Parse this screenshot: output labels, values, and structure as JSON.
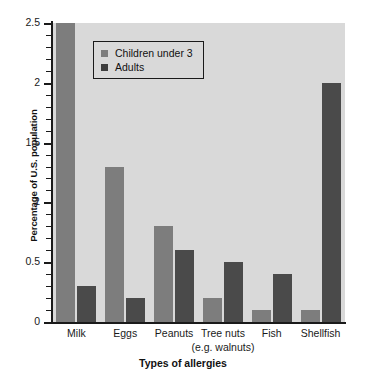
{
  "chart_data": {
    "type": "bar",
    "title": "",
    "xlabel": "Types of allergies",
    "ylabel": "Percentage of U.S. population",
    "categories": [
      "Milk",
      "Eggs",
      "Peanuts",
      "Tree nuts",
      "Fish",
      "Shellfish"
    ],
    "category_sublabels": [
      "",
      "",
      "",
      "(e.g. walnuts)",
      "",
      ""
    ],
    "series": [
      {
        "name": "Children under 3",
        "color": "#7d7d7d",
        "values": [
          2.5,
          1.3,
          0.8,
          0.2,
          0.1,
          0.1
        ]
      },
      {
        "name": "Adults",
        "color": "#4a4a4a",
        "values": [
          0.3,
          0.2,
          0.6,
          0.5,
          0.4,
          2.0
        ]
      }
    ],
    "ylim": [
      0,
      2.5
    ],
    "ytick_labels": [
      "0",
      "0.5",
      "1",
      "1.5",
      "2",
      "2.5"
    ],
    "ytick_values": [
      0,
      0.5,
      1,
      1.5,
      2,
      2.5
    ],
    "minor_tick_step": 0.1,
    "grid": false,
    "legend_position": "top-center",
    "plot_background": "#d9d9d9",
    "axis_color": "#1a1a1a"
  }
}
